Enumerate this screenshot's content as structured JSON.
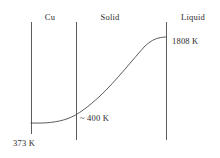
{
  "figure": {
    "title": "",
    "background_color": "#ffffff",
    "line_color": "#4a4a4a",
    "curve_color": "#4a4a4a",
    "text_color": "#2b2b2b",
    "width": 220,
    "height": 158
  },
  "region_labels": [
    {
      "name": "cu",
      "text": "Cu",
      "x": 50,
      "y": 12
    },
    {
      "name": "solid",
      "text": "Solid",
      "x": 110,
      "y": 12
    },
    {
      "name": "liquid",
      "text": "Liquid",
      "x": 193,
      "y": 12
    }
  ],
  "value_labels": [
    {
      "name": "temp-1808",
      "text": "1808 K",
      "x": 172,
      "y": 36
    },
    {
      "name": "temp-400",
      "text": "~ 400  K",
      "x": 80,
      "y": 113
    },
    {
      "name": "temp-373",
      "text": "373 K",
      "x": 13,
      "y": 138
    }
  ],
  "boundaries": [
    {
      "name": "boundary-cu-left",
      "x": 31,
      "y1": 22,
      "y2": 134
    },
    {
      "name": "boundary-cu-solid",
      "x": 76,
      "y1": 22,
      "y2": 140
    },
    {
      "name": "boundary-solid-liquid",
      "x": 166,
      "y1": 22,
      "y2": 140
    }
  ],
  "chart_data": {
    "type": "line",
    "title": "",
    "xlabel": "",
    "ylabel": "Temperature (K)",
    "grid": false,
    "legend": false,
    "annotations": [
      "Cu",
      "Solid",
      "Liquid",
      "1808 K",
      "~ 400  K",
      "373 K"
    ],
    "region_boundaries_x": [
      31,
      76,
      166
    ],
    "series": [
      {
        "name": "temperature-profile",
        "path": "M 31 123 C 45 123.5, 57 122.5, 68 118.5 C 78 114.8, 88 107, 100 96 C 116 81, 134 58, 145 46 C 152 39.5, 158 37.2, 166 37",
        "points": [
          {
            "x": 31,
            "y": 123,
            "label": "373 K"
          },
          {
            "x": 76,
            "y": 114,
            "label": "~ 400  K"
          },
          {
            "x": 166,
            "y": 37,
            "label": "1808 K"
          }
        ]
      }
    ]
  }
}
